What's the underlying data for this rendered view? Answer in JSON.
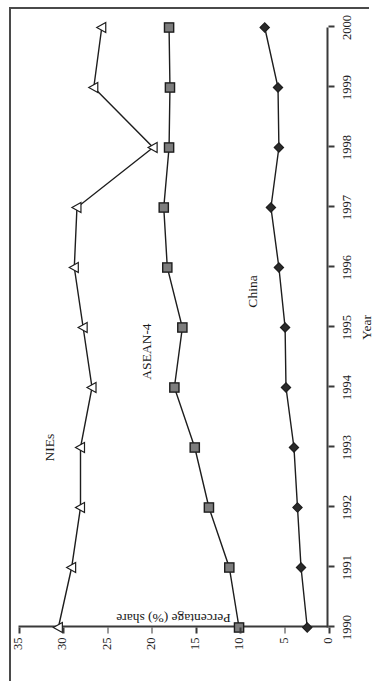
{
  "chart_data": {
    "type": "line",
    "title": "",
    "xlabel": "Year",
    "ylabel": "Percentage (%) share",
    "x": [
      1990,
      1991,
      1992,
      1993,
      1994,
      1995,
      1996,
      1997,
      1998,
      1999,
      2000
    ],
    "xticklabels": [
      "1990",
      "1991",
      "1992",
      "1993",
      "1994",
      "1995",
      "1996",
      "1997",
      "1998",
      "1999",
      "2000"
    ],
    "yticklabels": [
      "0",
      "5",
      "10",
      "15",
      "20",
      "25",
      "30",
      "35"
    ],
    "yticks": [
      0,
      5,
      10,
      15,
      20,
      25,
      30,
      35
    ],
    "ylim": [
      0,
      35
    ],
    "xlim": [
      1990,
      2000
    ],
    "grid": false,
    "legend": "inline-series-labels",
    "series": [
      {
        "name": "NIEs",
        "marker": "open-triangle",
        "color": "#1d1d1d",
        "values": [
          30.5,
          29.0,
          28.0,
          28.0,
          26.7,
          27.7,
          28.7,
          28.4,
          19.8,
          26.5,
          25.6
        ]
      },
      {
        "name": "ASEAN-4",
        "marker": "filled-square",
        "color": "#7d7d7d",
        "values": [
          10.1,
          11.2,
          13.5,
          15.1,
          17.4,
          16.5,
          18.2,
          18.6,
          18.0,
          17.9,
          18.0
        ]
      },
      {
        "name": "China",
        "marker": "filled-diamond",
        "color": "#2b2b2b",
        "values": [
          2.4,
          3.1,
          3.5,
          3.9,
          4.8,
          4.9,
          5.6,
          6.5,
          5.6,
          5.7,
          7.2
        ]
      }
    ],
    "annotations": [
      {
        "text": "NIEs",
        "near_x": 1993,
        "near_y": 31.5
      },
      {
        "text": "ASEAN-4",
        "near_x": 1994.6,
        "near_y": 20.6
      },
      {
        "text": "China",
        "near_x": 1995.6,
        "near_y": 8.6
      }
    ]
  }
}
